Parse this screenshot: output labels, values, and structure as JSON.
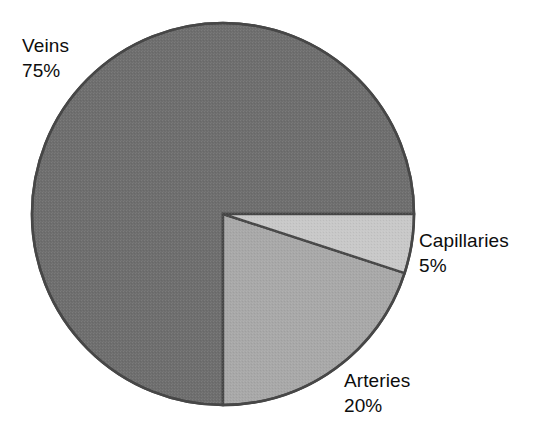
{
  "chart_data": {
    "type": "pie",
    "title": "",
    "subtitle": "",
    "xlabel": "",
    "ylabel": "",
    "categories": [
      "Capillaries",
      "Arteries",
      "Veins"
    ],
    "values": [
      5,
      20,
      75
    ],
    "value_unit": "%",
    "total": 100,
    "start_angle_deg": 0,
    "direction": "clockwise",
    "legend": "none",
    "grid": false,
    "slices": [
      {
        "id": "capillaries",
        "label": "Capillaries",
        "value": 5,
        "value_text": "5%",
        "color": "#c8c8c8",
        "start_angle_deg": 0,
        "end_angle_deg": 18
      },
      {
        "id": "arteries",
        "label": "Arteries",
        "value": 20,
        "value_text": "20%",
        "color": "#a8a8a8",
        "start_angle_deg": 18,
        "end_angle_deg": 90
      },
      {
        "id": "veins",
        "label": "Veins",
        "value": 75,
        "value_text": "75%",
        "color": "#6e6e6e",
        "start_angle_deg": 90,
        "end_angle_deg": 360
      }
    ],
    "annotations": [
      {
        "id": "veins-label",
        "text": "Veins",
        "value_text": "75%",
        "position": "upper-left"
      },
      {
        "id": "capillaries-label",
        "text": "Capillaries",
        "value_text": "5%",
        "position": "right"
      },
      {
        "id": "arteries-label",
        "text": "Arteries",
        "value_text": "20%",
        "position": "lower-right"
      }
    ],
    "colors": {
      "background": "#ffffff",
      "outline": "#474747",
      "text": "#0d0d0d",
      "veins": "#6e6e6e",
      "arteries": "#a8a8a8",
      "capillaries": "#c8c8c8"
    }
  },
  "labels": {
    "veins": {
      "name": "Veins",
      "value": "75%"
    },
    "capillaries": {
      "name": "Capillaries",
      "value": "5%"
    },
    "arteries": {
      "name": "Arteries",
      "value": "20%"
    }
  }
}
